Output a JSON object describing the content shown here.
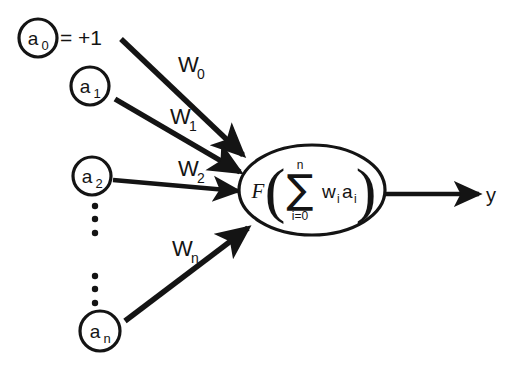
{
  "diagram": {
    "background_color": "#ffffff",
    "ink_color": "#141414",
    "input_nodes": [
      {
        "id": "a0",
        "label": "a",
        "subscript": "0",
        "cx": 38,
        "cy": 38,
        "r": 19,
        "annotation": "= +1"
      },
      {
        "id": "a1",
        "label": "a",
        "subscript": "1",
        "cx": 90,
        "cy": 86,
        "r": 19,
        "annotation": ""
      },
      {
        "id": "a2",
        "label": "a",
        "subscript": "2",
        "cx": 92,
        "cy": 176,
        "r": 19,
        "annotation": ""
      },
      {
        "id": "an",
        "label": "a",
        "subscript": "n",
        "cx": 100,
        "cy": 331,
        "r": 20,
        "annotation": ""
      }
    ],
    "weights": [
      {
        "id": "w0",
        "label": "W",
        "subscript": "0",
        "x": 178,
        "y": 72
      },
      {
        "id": "w1",
        "label": "W",
        "subscript": "1",
        "x": 170,
        "y": 124
      },
      {
        "id": "w2",
        "label": "W",
        "subscript": "2",
        "x": 178,
        "y": 176
      },
      {
        "id": "wn",
        "label": "W",
        "subscript": "n",
        "x": 172,
        "y": 256
      }
    ],
    "ellipsis_groups": [
      {
        "id": "ellipsis-upper",
        "cx": 95,
        "dots_y": [
          206,
          219,
          233
        ]
      },
      {
        "id": "ellipsis-lower",
        "cx": 95,
        "dots_y": [
          276,
          289,
          303
        ]
      }
    ],
    "neuron": {
      "cx": 312,
      "cy": 190,
      "rx": 73,
      "ry": 45,
      "function_symbol": "F",
      "sigma_symbol": "∑",
      "upper_limit": "n",
      "lower_limit": "i=0",
      "summand_w": "w",
      "summand_w_sub": "i",
      "summand_a": "a",
      "summand_a_sub": "i",
      "left_paren": "(",
      "right_paren": ")",
      "expression_text": "F( ∑ (i=0 to n) w_i a_i )"
    },
    "output": {
      "label": "y",
      "x": 491,
      "y": 203,
      "arrow_start_x": 385,
      "arrow_end_x": 478,
      "arrow_y": 194
    }
  }
}
